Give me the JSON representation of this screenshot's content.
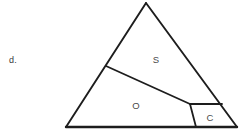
{
  "question_choice": {
    "letter": "d."
  },
  "figure": {
    "stroke_color": "#1d1d1d",
    "label_color": "#4a4a4a",
    "background_color": "#ffffff",
    "vertices": {
      "apex": {
        "x": 146,
        "y": 3
      },
      "bottom_left": {
        "x": 66,
        "y": 127
      },
      "bottom_right": {
        "x": 237,
        "y": 127
      },
      "left_edge_point": {
        "x": 106,
        "y": 66
      },
      "interior_junction": {
        "x": 190,
        "y": 104
      },
      "base_point": {
        "x": 196,
        "y": 127
      },
      "right_edge_point": {
        "x": 222,
        "y": 104
      }
    },
    "regions": [
      {
        "id": "region-s",
        "label": "S",
        "label_x": 156,
        "label_y": 60
      },
      {
        "id": "region-o",
        "label": "O",
        "label_x": 136,
        "label_y": 106
      },
      {
        "id": "region-c",
        "label": "C",
        "label_x": 210,
        "label_y": 118
      }
    ],
    "paths": {
      "triangle": "M 146,3 L 237,127 L 66,127 Z",
      "divider_left_to_junction": "M 106,66 L 190,104",
      "junction_to_base": "M 190,104 L 196,127",
      "junction_to_right_edge": "M 190,104 L 222,104"
    }
  }
}
